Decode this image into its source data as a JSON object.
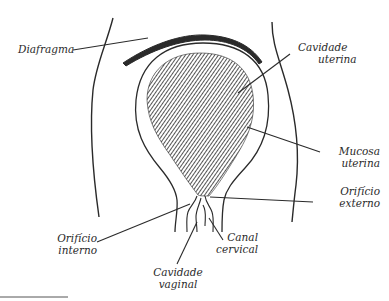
{
  "diagram": {
    "colors": {
      "ink": "#2a2a2a",
      "background": "#ffffff"
    },
    "labels": {
      "diafragma": {
        "line1": "Diafragma"
      },
      "cavidade_uterina": {
        "line1": "Cavidade",
        "line2": "uterina"
      },
      "mucosa_uterina": {
        "line1": "Mucosa",
        "line2": "uterina"
      },
      "orificio_externo": {
        "line1": "Orifício",
        "line2": "externo"
      },
      "orificio_interno": {
        "line1": "Orifício",
        "line2": "interno"
      },
      "canal_cervical": {
        "line1": "Canal",
        "line2": "cervical"
      },
      "cavidade_vaginal": {
        "line1": "Cavidade",
        "line2": "vaginal"
      }
    }
  }
}
